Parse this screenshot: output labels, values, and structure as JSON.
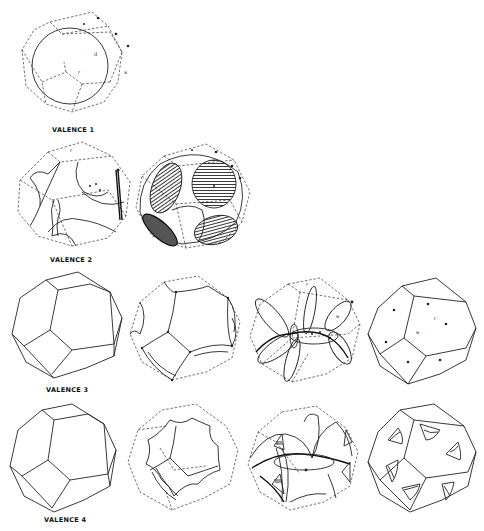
{
  "figure": {
    "ink_color": "#222222",
    "background": "#ffffff",
    "rows": [
      {
        "label": "VALENCE 1",
        "panels": [
          {
            "name": "sphere-in-zone",
            "point_labels": [
              "a",
              "a",
              "a",
              "d",
              "r",
              "a"
            ]
          }
        ]
      },
      {
        "label": "VALENCE 2",
        "panels": [
          {
            "name": "second-zone-holes",
            "point_labels": [
              "r",
              "a",
              "a",
              "a"
            ]
          },
          {
            "name": "hatched-contacts",
            "point_labels": [
              "a",
              "a",
              "a",
              "a",
              "a"
            ]
          }
        ]
      },
      {
        "label": "VALENCE 3",
        "panels": [
          {
            "name": "zone-solid",
            "point_labels": []
          },
          {
            "name": "zone-curved-edges",
            "point_labels": []
          },
          {
            "name": "zone-lens-surfaces",
            "point_labels": [
              "r",
              "a"
            ]
          },
          {
            "name": "zone-with-points",
            "point_labels": [
              "r",
              "a"
            ]
          }
        ]
      },
      {
        "label": "VALENCE 4",
        "panels": [
          {
            "name": "zone-solid",
            "point_labels": []
          },
          {
            "name": "zone-concave-faces",
            "point_labels": []
          },
          {
            "name": "zone-pockets-lenses",
            "point_labels": []
          },
          {
            "name": "zone-triangular-pockets",
            "point_labels": []
          }
        ]
      }
    ]
  }
}
